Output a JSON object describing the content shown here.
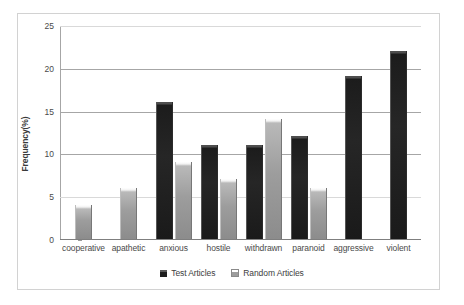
{
  "chart_data": {
    "type": "bar",
    "title": "",
    "xlabel": "",
    "ylabel": "Frequency(%)",
    "ylim": [
      0,
      25
    ],
    "yticks": [
      0,
      5,
      10,
      15,
      20,
      25
    ],
    "grid": true,
    "legend_position": "bottom",
    "categories": [
      "cooperative",
      "apathetic",
      "anxious",
      "hostile",
      "withdrawn",
      "paranoid",
      "aggressive",
      "violent"
    ],
    "series": [
      {
        "name": "Test Articles",
        "color": "#1f1f1f",
        "values": [
          0,
          0,
          16,
          11,
          11,
          12,
          19,
          22
        ]
      },
      {
        "name": "Random Articles",
        "color": "#9d9d9d",
        "values": [
          4,
          6,
          9,
          7,
          14,
          6,
          0,
          0
        ]
      }
    ]
  },
  "axis": {
    "y_title": "Frequency(%)",
    "y_tick_labels": [
      "25",
      "20",
      "15",
      "10",
      "5",
      "0"
    ],
    "x_tick_labels": [
      "cooperative",
      "apathetic",
      "anxious",
      "hostile",
      "withdrawn",
      "paranoid",
      "aggressive",
      "violent"
    ]
  },
  "legend": {
    "items": [
      {
        "label": "Test Articles",
        "swatch": "test"
      },
      {
        "label": "Random Articles",
        "swatch": "random"
      }
    ]
  },
  "colors": {
    "test_series": "#1f1f1f",
    "random_series": "#9d9d9d",
    "gridline": "#a6a6a6",
    "frame": "#d2d2d2",
    "text": "#4a4a4a",
    "background": "#ffffff"
  }
}
